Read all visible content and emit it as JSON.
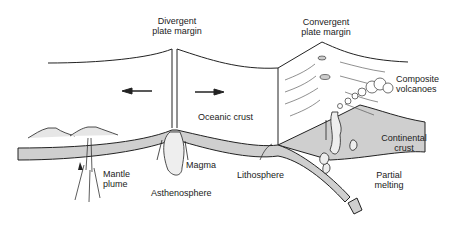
{
  "diagram": {
    "type": "cross-section",
    "labels": {
      "divergent_1": "Divergent",
      "divergent_2": "plate margin",
      "convergent_1": "Convergent",
      "convergent_2": "plate margin",
      "composite_1": "Composite",
      "composite_2": "volcanoes",
      "oceanic_crust": "Oceanic crust",
      "continental_1": "Continental",
      "continental_2": "crust",
      "mantle_1": "Mantle",
      "mantle_2": "plume",
      "magma": "Magma",
      "asthenosphere": "Asthenosphere",
      "lithosphere": "Lithosphere",
      "partial_1": "Partial",
      "partial_2": "melting"
    },
    "colors": {
      "ink": "#222222",
      "fill": "#cfcfcf",
      "paper": "#ffffff"
    }
  }
}
